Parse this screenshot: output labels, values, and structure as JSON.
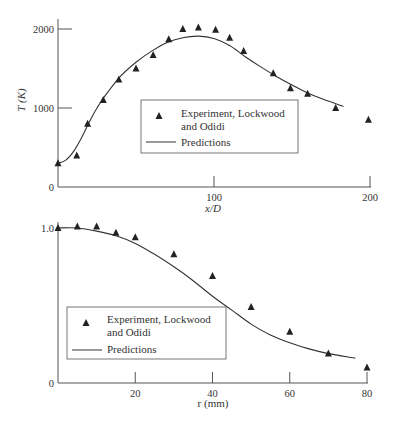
{
  "colors": {
    "axis": "#555555",
    "line": "#333333",
    "marker": "#222222",
    "text": "#333333",
    "legend_border": "#555555"
  },
  "chart_data": [
    {
      "type": "scatter",
      "title": "",
      "xlabel": "x/D",
      "ylabel": "T (K)",
      "xlim": [
        0,
        200
      ],
      "ylim": [
        0,
        2000
      ],
      "x_ticks": [
        0,
        100,
        200
      ],
      "x_tick_labels": [
        "",
        "100",
        "200"
      ],
      "y_ticks": [
        0,
        1000,
        2000
      ],
      "y_tick_labels": [
        "0",
        "1000",
        "2000"
      ],
      "grid": false,
      "legend_position": "center-right inside",
      "series": [
        {
          "name": "Experiment, Lockwood and Odidi",
          "kind": "markers",
          "marker": "triangle",
          "x": [
            0,
            12,
            19,
            29,
            39,
            50,
            61,
            71,
            80,
            90,
            101,
            110,
            119,
            138,
            149,
            160,
            178,
            199
          ],
          "y": [
            300,
            400,
            800,
            1100,
            1360,
            1500,
            1670,
            1870,
            2000,
            2020,
            1990,
            1890,
            1720,
            1440,
            1250,
            1180,
            1000,
            850
          ]
        },
        {
          "name": "Predictions",
          "kind": "line",
          "x": [
            0,
            5,
            10,
            15,
            20,
            25,
            30,
            40,
            50,
            60,
            70,
            80,
            90,
            100,
            110,
            120,
            130,
            140,
            150,
            160,
            170,
            183
          ],
          "y": [
            300,
            340,
            450,
            620,
            820,
            1000,
            1150,
            1400,
            1580,
            1720,
            1830,
            1890,
            1910,
            1880,
            1790,
            1650,
            1520,
            1400,
            1290,
            1190,
            1110,
            1020
          ]
        }
      ]
    },
    {
      "type": "scatter",
      "title": "",
      "xlabel": "r (mm)",
      "ylabel": "",
      "xlim": [
        0,
        80
      ],
      "ylim": [
        0,
        1.0
      ],
      "x_ticks": [
        0,
        20,
        40,
        60,
        80
      ],
      "x_tick_labels": [
        "",
        "20",
        "40",
        "60",
        "80"
      ],
      "y_ticks": [
        0,
        1.0
      ],
      "y_tick_labels": [
        "0",
        "1.0"
      ],
      "grid": false,
      "legend_position": "lower-left inside",
      "series": [
        {
          "name": "Experiment, Lockwood and Odidi",
          "kind": "markers",
          "marker": "triangle",
          "x": [
            0,
            5,
            10,
            15,
            20,
            30,
            40,
            50,
            60,
            70,
            80
          ],
          "y": [
            1.0,
            1.01,
            1.01,
            0.97,
            0.94,
            0.83,
            0.69,
            0.49,
            0.33,
            0.19,
            0.1
          ]
        },
        {
          "name": "Predictions",
          "kind": "line",
          "x": [
            0,
            5,
            10,
            15,
            20,
            25,
            30,
            35,
            40,
            45,
            50,
            55,
            60,
            65,
            70,
            77
          ],
          "y": [
            1.0,
            1.0,
            0.98,
            0.95,
            0.9,
            0.83,
            0.75,
            0.66,
            0.56,
            0.47,
            0.38,
            0.31,
            0.26,
            0.22,
            0.19,
            0.16
          ]
        }
      ]
    }
  ],
  "legends": [
    {
      "marker_label_line1": "Experiment, Lockwood",
      "marker_label_line2": "and Odidi",
      "line_label": "Predictions"
    },
    {
      "marker_label_line1": "Experiment, Lockwood",
      "marker_label_line2": "and Odidi",
      "line_label": "Predictions"
    }
  ],
  "axis_titles": {
    "top_x": "x/D",
    "top_y": "T (K)",
    "bottom_x": "r (mm)"
  }
}
